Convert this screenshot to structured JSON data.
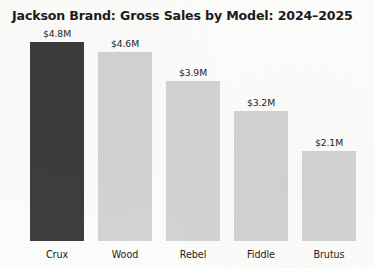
{
  "chart_data": {
    "type": "bar",
    "title": "Jackson Brand: Gross Sales by Model: 2024–2025",
    "xlabel": "",
    "ylabel": "",
    "categories": [
      "Crux",
      "Wood",
      "Rebel",
      "Fiddle",
      "Brutus"
    ],
    "values": [
      4.8,
      4.6,
      3.9,
      3.2,
      2.1
    ],
    "value_labels": [
      "$4.8M",
      "$4.6M",
      "$3.9M",
      "$3.2M",
      "$2.1M"
    ],
    "value_unit": "millions of dollars",
    "ylim": [
      0,
      4.8
    ],
    "grid": false,
    "legend": false,
    "highlighted_category": "Crux",
    "bar_colors": [
      "#3d3d3d",
      "#d3d3d3",
      "#d3d3d3",
      "#d3d3d3",
      "#d3d3d3"
    ],
    "colors": {
      "highlight_bar": "#3d3d3d",
      "default_bar": "#d3d3d3",
      "title_text": "#1b1b1b",
      "label_text": "#262626",
      "background": "#fcfcfb"
    }
  },
  "bars": [
    {
      "category": "Crux",
      "value_label": "$4.8M",
      "left": 30,
      "width": 54,
      "height": 199,
      "color": "#3d3d3d"
    },
    {
      "category": "Wood",
      "value_label": "$4.6M",
      "left": 98,
      "width": 54,
      "height": 189,
      "color": "#d3d3d3"
    },
    {
      "category": "Rebel",
      "value_label": "$3.9M",
      "left": 166,
      "width": 54,
      "height": 160,
      "color": "#d3d3d3"
    },
    {
      "category": "Fiddle",
      "value_label": "$3.2M",
      "left": 234,
      "width": 54,
      "height": 130,
      "color": "#d3d3d3"
    },
    {
      "category": "Brutus",
      "value_label": "$2.1M",
      "left": 302,
      "width": 54,
      "height": 90,
      "color": "#d3d3d3"
    }
  ]
}
